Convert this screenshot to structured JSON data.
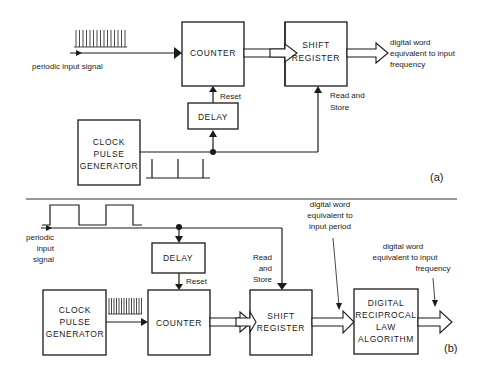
{
  "diagram": {
    "part_a": {
      "panel_label": "(a)",
      "input_signal_label": "periodic input signal",
      "blocks": {
        "counter": "COUNTER",
        "shift_register": [
          "SHIFT",
          "REGISTER"
        ],
        "delay": "DELAY",
        "clock": [
          "CLOCK",
          "PULSE",
          "GENERATOR"
        ]
      },
      "reset_label": "Reset",
      "read_store_label": [
        "Read and",
        "Store"
      ],
      "output_label": [
        "digital word",
        "equivalent to input",
        "frequency"
      ]
    },
    "part_b": {
      "panel_label": "(b)",
      "input_signal_label": [
        "periodic",
        "input",
        "signal"
      ],
      "blocks": {
        "delay": "DELAY",
        "clock": [
          "CLOCK",
          "PULSE",
          "GENERATOR"
        ],
        "counter": "COUNTER",
        "shift_register": [
          "SHIFT",
          "REGISTER"
        ],
        "reciprocal": [
          "DIGITAL",
          "RECIPROCAL",
          "LAW",
          "ALGORITHM"
        ]
      },
      "reset_label": "Reset",
      "read_store_label": [
        "Read",
        "and",
        "Store"
      ],
      "period_label": [
        "digital word",
        "equivalent to",
        "input period"
      ],
      "frequency_label": [
        "digital word",
        "equivalent to input",
        "frequency"
      ]
    }
  }
}
